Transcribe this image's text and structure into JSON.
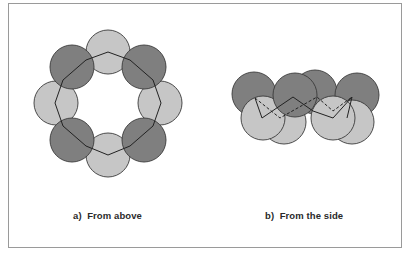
{
  "figure": {
    "panels": [
      {
        "id": "a",
        "caption": "a)  From above",
        "view": "top"
      },
      {
        "id": "b",
        "caption": "b)  From the side",
        "view": "side"
      }
    ],
    "colors": {
      "light_atom": "#c4c4c4",
      "dark_atom": "#7e7e7e",
      "outline": "#3a3a3a",
      "frame": "#9a9a9a"
    }
  }
}
